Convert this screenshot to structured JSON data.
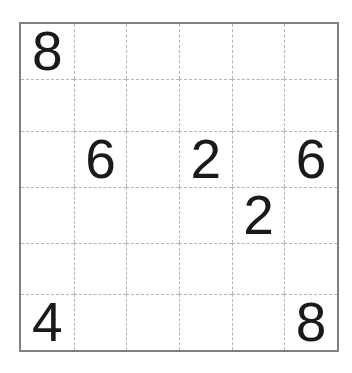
{
  "puzzle": {
    "kind": "number-grid-puzzle",
    "rows": 6,
    "cols": 6,
    "cells": [
      [
        "8",
        "",
        "",
        "",
        "",
        ""
      ],
      [
        "",
        "",
        "",
        "",
        "",
        ""
      ],
      [
        "",
        "6",
        "",
        "2",
        "",
        "6"
      ],
      [
        "",
        "",
        "",
        "",
        "2",
        ""
      ],
      [
        "",
        "",
        "",
        "",
        "",
        ""
      ],
      [
        "4",
        "",
        "",
        "",
        "",
        "8"
      ]
    ],
    "givens": [
      {
        "row": 1,
        "col": 1,
        "value": "8"
      },
      {
        "row": 3,
        "col": 2,
        "value": "6"
      },
      {
        "row": 3,
        "col": 4,
        "value": "2"
      },
      {
        "row": 3,
        "col": 6,
        "value": "6"
      },
      {
        "row": 4,
        "col": 5,
        "value": "2"
      },
      {
        "row": 6,
        "col": 1,
        "value": "4"
      },
      {
        "row": 6,
        "col": 6,
        "value": "8"
      }
    ],
    "colors": {
      "background": "#ffffff",
      "outer_border": "#7f7f7f",
      "grid_lines": "#b5b5b5",
      "digits": "#1a1a1a"
    }
  }
}
